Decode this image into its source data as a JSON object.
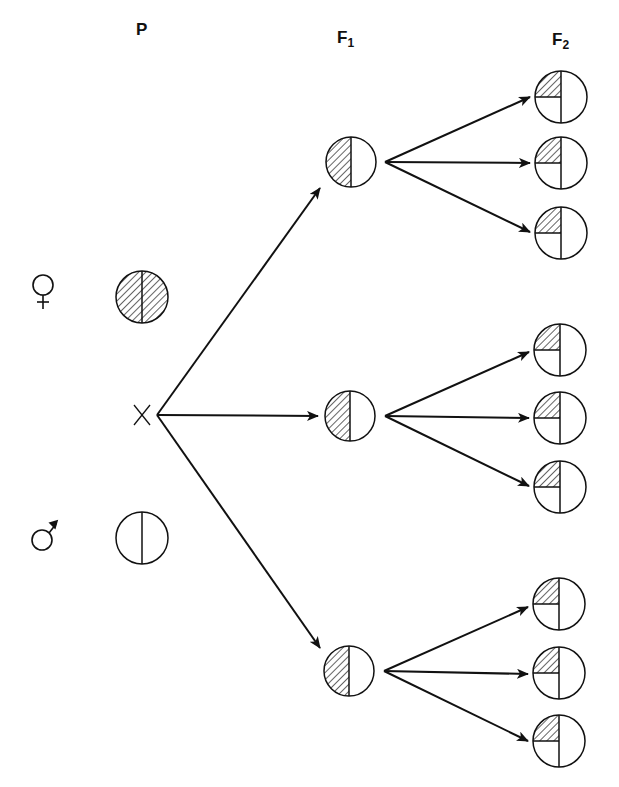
{
  "generations": {
    "p": {
      "label": "P",
      "sub": ""
    },
    "f1": {
      "label": "F",
      "sub": "1"
    },
    "f2": {
      "label": "F",
      "sub": "2"
    }
  },
  "symbols": {
    "female": "female-symbol",
    "male": "male-symbol",
    "cross": "X"
  },
  "parents": [
    {
      "sex": "female",
      "fill": "fully hatched",
      "cx": 142,
      "cy": 297
    },
    {
      "sex": "male",
      "fill": "empty",
      "cx": 142,
      "cy": 538
    }
  ],
  "f1": [
    {
      "fill": "left half hatched",
      "cx": 351,
      "cy": 162
    },
    {
      "fill": "left half hatched",
      "cx": 350,
      "cy": 416
    },
    {
      "fill": "left half hatched",
      "cx": 349,
      "cy": 671
    }
  ],
  "f2": [
    {
      "fill": "upper-left quarter hatched",
      "cx": 561,
      "cy": 97
    },
    {
      "fill": "upper-left quarter hatched",
      "cx": 561,
      "cy": 163
    },
    {
      "fill": "upper-left quarter hatched",
      "cx": 561,
      "cy": 233
    },
    {
      "fill": "upper-left quarter hatched",
      "cx": 560,
      "cy": 350
    },
    {
      "fill": "upper-left quarter hatched",
      "cx": 560,
      "cy": 418
    },
    {
      "fill": "upper-left quarter hatched",
      "cx": 560,
      "cy": 487
    },
    {
      "fill": "upper-left quarter hatched",
      "cx": 559,
      "cy": 604
    },
    {
      "fill": "upper-left quarter hatched",
      "cx": 559,
      "cy": 673
    },
    {
      "fill": "upper-left quarter hatched",
      "cx": 559,
      "cy": 741
    }
  ],
  "colors": {
    "ink": "#111111",
    "paper": "#ffffff"
  }
}
